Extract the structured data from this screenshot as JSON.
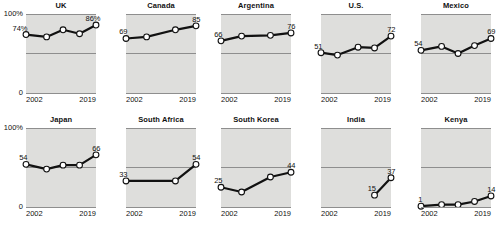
{
  "axis": {
    "y_top_label": "100%",
    "y_bottom_label": "0",
    "x_start_label": "2002",
    "x_end_label": "2019"
  },
  "colors": {
    "plot_background": "#dededc",
    "line": "#111111",
    "marker_fill": "#ffffff",
    "rule": "#8e8e8e",
    "text": "#111111"
  },
  "chart_data": {
    "type": "line",
    "title": "",
    "xlabel": "",
    "ylabel": "",
    "ylim": [
      0,
      100
    ],
    "xlim": [
      2002,
      2019
    ],
    "grid": "horizontal midline at 50%",
    "legend": "none",
    "layout": "small multiples, 5 columns x 2 rows",
    "panels": [
      {
        "name": "UK",
        "row": 1,
        "col": 1,
        "x": [
          2002,
          2007,
          2011,
          2015,
          2019
        ],
        "values": [
          74,
          71,
          80,
          75,
          86
        ],
        "first_label": "74%",
        "last_label": "86%"
      },
      {
        "name": "Canada",
        "row": 1,
        "col": 2,
        "x": [
          2002,
          2007,
          2014,
          2019
        ],
        "values": [
          69,
          71,
          80,
          85
        ],
        "first_label": "69",
        "last_label": "85"
      },
      {
        "name": "Argentina",
        "row": 1,
        "col": 3,
        "x": [
          2002,
          2007,
          2014,
          2019
        ],
        "values": [
          66,
          72,
          73,
          76
        ],
        "first_label": "66",
        "last_label": "76"
      },
      {
        "name": "U.S.",
        "row": 1,
        "col": 4,
        "x": [
          2002,
          2006,
          2011,
          2015,
          2019
        ],
        "values": [
          51,
          48,
          58,
          57,
          72
        ],
        "first_label": "51",
        "last_label": "72"
      },
      {
        "name": "Mexico",
        "row": 1,
        "col": 5,
        "x": [
          2002,
          2007,
          2011,
          2015,
          2019
        ],
        "values": [
          54,
          59,
          50,
          60,
          69
        ],
        "first_label": "54",
        "last_label": "69"
      },
      {
        "name": "Japan",
        "row": 2,
        "col": 1,
        "x": [
          2002,
          2007,
          2011,
          2015,
          2019
        ],
        "values": [
          54,
          48,
          53,
          53,
          66
        ],
        "first_label": "54",
        "last_label": "66"
      },
      {
        "name": "South Africa",
        "row": 2,
        "col": 2,
        "x": [
          2002,
          2014,
          2019
        ],
        "values": [
          33,
          33,
          54
        ],
        "first_label": "33",
        "last_label": "54"
      },
      {
        "name": "South Korea",
        "row": 2,
        "col": 3,
        "x": [
          2002,
          2007,
          2014,
          2019
        ],
        "values": [
          25,
          19,
          38,
          44
        ],
        "first_label": "25",
        "last_label": "44"
      },
      {
        "name": "India",
        "row": 2,
        "col": 4,
        "x": [
          2015,
          2019
        ],
        "values": [
          15,
          37
        ],
        "first_label": "15",
        "last_label": "37"
      },
      {
        "name": "Kenya",
        "row": 2,
        "col": 5,
        "x": [
          2002,
          2007,
          2011,
          2015,
          2019
        ],
        "values": [
          1,
          3,
          3,
          7,
          14
        ],
        "first_label": "1",
        "last_label": "14"
      }
    ]
  }
}
